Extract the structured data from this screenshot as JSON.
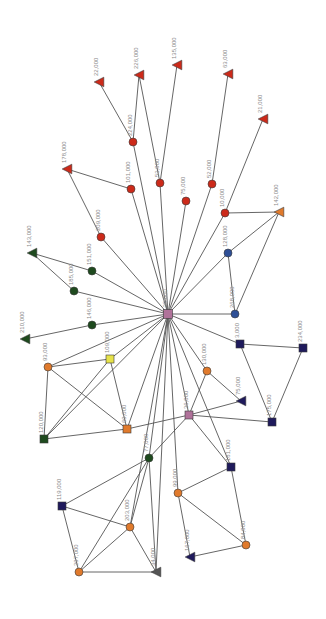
{
  "diagram": {
    "type": "network-graph",
    "hub_node_id": "n_center",
    "colors": {
      "red": "#cc2a1a",
      "orange": "#e07a2c",
      "dark_green": "#1e4a1e",
      "navy": "#1f1a5c",
      "blue": "#2e4f96",
      "pink": "#b0729a",
      "yellow": "#e6e24a",
      "gray": "#555555",
      "edge": "#555555",
      "label": "#8a8a8a"
    },
    "nodes": [
      {
        "id": "n_center",
        "label": "33,000",
        "shape": "square",
        "color": "pink",
        "x": 168,
        "y": 314,
        "size": 9
      },
      {
        "id": "n22",
        "label": "22,000",
        "shape": "triangle",
        "color": "red",
        "x": 99,
        "y": 82,
        "size": 8
      },
      {
        "id": "n226",
        "label": "226,000",
        "shape": "triangle",
        "color": "red",
        "x": 139,
        "y": 75,
        "size": 8
      },
      {
        "id": "n135",
        "label": "135,000",
        "shape": "triangle",
        "color": "red",
        "x": 177,
        "y": 65,
        "size": 8
      },
      {
        "id": "n63",
        "label": "63,000",
        "shape": "triangle",
        "color": "red",
        "x": 228,
        "y": 74,
        "size": 8
      },
      {
        "id": "n21",
        "label": "21,000",
        "shape": "triangle",
        "color": "red",
        "x": 263,
        "y": 119,
        "size": 8
      },
      {
        "id": "n178",
        "label": "178,000",
        "shape": "triangle",
        "color": "red",
        "x": 67,
        "y": 169,
        "size": 8
      },
      {
        "id": "n224",
        "label": "224,000",
        "shape": "circle",
        "color": "red",
        "x": 133,
        "y": 142,
        "size": 8
      },
      {
        "id": "n101",
        "label": "101,000",
        "shape": "circle",
        "color": "red",
        "x": 131,
        "y": 189,
        "size": 8
      },
      {
        "id": "n53",
        "label": "53,000",
        "shape": "circle",
        "color": "red",
        "x": 160,
        "y": 183,
        "size": 8
      },
      {
        "id": "n75",
        "label": "75,000",
        "shape": "circle",
        "color": "red",
        "x": 186,
        "y": 201,
        "size": 8
      },
      {
        "id": "n52",
        "label": "52,000",
        "shape": "circle",
        "color": "red",
        "x": 212,
        "y": 184,
        "size": 8
      },
      {
        "id": "n10",
        "label": "10,000",
        "shape": "circle",
        "color": "red",
        "x": 225,
        "y": 213,
        "size": 8
      },
      {
        "id": "n209",
        "label": "209,000",
        "shape": "circle",
        "color": "red",
        "x": 101,
        "y": 237,
        "size": 8
      },
      {
        "id": "n142",
        "label": "142,000",
        "shape": "triangle",
        "color": "orange",
        "x": 279,
        "y": 212,
        "size": 8
      },
      {
        "id": "n128",
        "label": "128,000",
        "shape": "circle",
        "color": "blue",
        "x": 228,
        "y": 253,
        "size": 8
      },
      {
        "id": "n268",
        "label": "268,000",
        "shape": "circle",
        "color": "blue",
        "x": 235,
        "y": 314,
        "size": 8
      },
      {
        "id": "n143",
        "label": "143,000",
        "shape": "triangle",
        "color": "dark_green",
        "x": 32,
        "y": 253,
        "size": 8
      },
      {
        "id": "n151",
        "label": "151,000",
        "shape": "circle",
        "color": "dark_green",
        "x": 92,
        "y": 271,
        "size": 8
      },
      {
        "id": "n185",
        "label": "185,000",
        "shape": "circle",
        "color": "dark_green",
        "x": 74,
        "y": 291,
        "size": 8
      },
      {
        "id": "n146",
        "label": "146,000",
        "shape": "circle",
        "color": "dark_green",
        "x": 92,
        "y": 325,
        "size": 8
      },
      {
        "id": "n210",
        "label": "210,000",
        "shape": "triangle",
        "color": "dark_green",
        "x": 25,
        "y": 339,
        "size": 8
      },
      {
        "id": "n93",
        "label": "93,000",
        "shape": "circle",
        "color": "orange",
        "x": 48,
        "y": 367,
        "size": 8
      },
      {
        "id": "n109",
        "label": "109,000",
        "shape": "square",
        "color": "yellow",
        "x": 110,
        "y": 359,
        "size": 8
      },
      {
        "id": "n120",
        "label": "120,000",
        "shape": "square",
        "color": "dark_green",
        "x": 44,
        "y": 439,
        "size": 8
      },
      {
        "id": "n69",
        "label": "69,000",
        "shape": "square",
        "color": "orange",
        "x": 127,
        "y": 429,
        "size": 8
      },
      {
        "id": "n3",
        "label": "3,000",
        "shape": "square",
        "color": "navy",
        "x": 240,
        "y": 344,
        "size": 8
      },
      {
        "id": "n234",
        "label": "234,000",
        "shape": "square",
        "color": "navy",
        "x": 303,
        "y": 348,
        "size": 8
      },
      {
        "id": "n130",
        "label": "130,000",
        "shape": "circle",
        "color": "orange",
        "x": 207,
        "y": 371,
        "size": 8
      },
      {
        "id": "n75b",
        "label": "75,000",
        "shape": "triangle",
        "color": "navy",
        "x": 241,
        "y": 401,
        "size": 8
      },
      {
        "id": "n36",
        "label": "36,000",
        "shape": "square",
        "color": "pink",
        "x": 189,
        "y": 415,
        "size": 8
      },
      {
        "id": "n175",
        "label": "175,000",
        "shape": "square",
        "color": "navy",
        "x": 272,
        "y": 422,
        "size": 8
      },
      {
        "id": "n77",
        "label": "77,000",
        "shape": "circle",
        "color": "dark_green",
        "x": 149,
        "y": 458,
        "size": 8
      },
      {
        "id": "n181",
        "label": "181,000",
        "shape": "square",
        "color": "navy",
        "x": 231,
        "y": 467,
        "size": 8
      },
      {
        "id": "n99",
        "label": "99,000",
        "shape": "circle",
        "color": "orange",
        "x": 178,
        "y": 493,
        "size": 8
      },
      {
        "id": "n167",
        "label": "167,000",
        "shape": "triangle",
        "color": "navy",
        "x": 190,
        "y": 557,
        "size": 8
      },
      {
        "id": "n84",
        "label": "84,000",
        "shape": "circle",
        "color": "orange",
        "x": 246,
        "y": 545,
        "size": 8
      },
      {
        "id": "n119",
        "label": "119,000",
        "shape": "square",
        "color": "navy",
        "x": 62,
        "y": 506,
        "size": 8
      },
      {
        "id": "n203",
        "label": "203,000",
        "shape": "circle",
        "color": "orange",
        "x": 130,
        "y": 527,
        "size": 8
      },
      {
        "id": "n297",
        "label": "297,000",
        "shape": "circle",
        "color": "orange",
        "x": 79,
        "y": 572,
        "size": 8
      },
      {
        "id": "n34",
        "label": "34,000",
        "shape": "triangle",
        "color": "gray",
        "x": 156,
        "y": 572,
        "size": 8
      }
    ],
    "edges": [
      [
        "n_center",
        "n224"
      ],
      [
        "n_center",
        "n101"
      ],
      [
        "n_center",
        "n53"
      ],
      [
        "n_center",
        "n75"
      ],
      [
        "n_center",
        "n52"
      ],
      [
        "n_center",
        "n10"
      ],
      [
        "n_center",
        "n209"
      ],
      [
        "n_center",
        "n128"
      ],
      [
        "n_center",
        "n268"
      ],
      [
        "n_center",
        "n151"
      ],
      [
        "n_center",
        "n185"
      ],
      [
        "n_center",
        "n146"
      ],
      [
        "n_center",
        "n93"
      ],
      [
        "n_center",
        "n109"
      ],
      [
        "n_center",
        "n69"
      ],
      [
        "n_center",
        "n3"
      ],
      [
        "n_center",
        "n130"
      ],
      [
        "n_center",
        "n36"
      ],
      [
        "n_center",
        "n77"
      ],
      [
        "n_center",
        "n99"
      ],
      [
        "n_center",
        "n181"
      ],
      [
        "n_center",
        "n120"
      ],
      [
        "n_center",
        "n203"
      ],
      [
        "n_center",
        "n34"
      ],
      [
        "n224",
        "n22"
      ],
      [
        "n224",
        "n226"
      ],
      [
        "n53",
        "n226"
      ],
      [
        "n53",
        "n135"
      ],
      [
        "n52",
        "n63"
      ],
      [
        "n10",
        "n21"
      ],
      [
        "n101",
        "n178"
      ],
      [
        "n209",
        "n178"
      ],
      [
        "n10",
        "n142"
      ],
      [
        "n128",
        "n142"
      ],
      [
        "n268",
        "n142"
      ],
      [
        "n128",
        "n268"
      ],
      [
        "n151",
        "n143"
      ],
      [
        "n185",
        "n143"
      ],
      [
        "n146",
        "n210"
      ],
      [
        "n93",
        "n109"
      ],
      [
        "n93",
        "n120"
      ],
      [
        "n93",
        "n69"
      ],
      [
        "n109",
        "n120"
      ],
      [
        "n109",
        "n69"
      ],
      [
        "n120",
        "n69"
      ],
      [
        "n69",
        "n36"
      ],
      [
        "n3",
        "n234"
      ],
      [
        "n3",
        "n175"
      ],
      [
        "n234",
        "n175"
      ],
      [
        "n36",
        "n175"
      ],
      [
        "n36",
        "n130"
      ],
      [
        "n130",
        "n75b"
      ],
      [
        "n36",
        "n75b"
      ],
      [
        "n36",
        "n181"
      ],
      [
        "n36",
        "n77"
      ],
      [
        "n77",
        "n119"
      ],
      [
        "n77",
        "n203"
      ],
      [
        "n77",
        "n297"
      ],
      [
        "n77",
        "n34"
      ],
      [
        "n119",
        "n203"
      ],
      [
        "n119",
        "n297"
      ],
      [
        "n203",
        "n297"
      ],
      [
        "n203",
        "n34"
      ],
      [
        "n297",
        "n34"
      ],
      [
        "n181",
        "n99"
      ],
      [
        "n181",
        "n84"
      ],
      [
        "n99",
        "n84"
      ],
      [
        "n99",
        "n167"
      ],
      [
        "n84",
        "n167"
      ]
    ]
  }
}
